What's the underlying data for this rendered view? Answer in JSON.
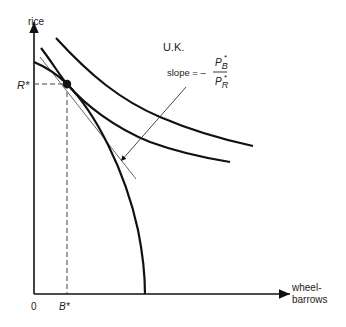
{
  "diagram": {
    "y_axis_label": "rice",
    "x_axis_label_line1": "wheel-",
    "x_axis_label_line2": "barrows",
    "origin_label": "0",
    "r_star_label": "R*",
    "b_star_label": "B*",
    "country_label": "U.K.",
    "slope_text": "slope = –",
    "slope_numerator": "P",
    "slope_numerator_sub": "B",
    "slope_denominator": "P",
    "slope_denominator_sub": "R",
    "star": "*",
    "colors": {
      "curve": "#111111",
      "tangent": "#666666",
      "dashed": "#444444",
      "text": "#222222"
    }
  }
}
